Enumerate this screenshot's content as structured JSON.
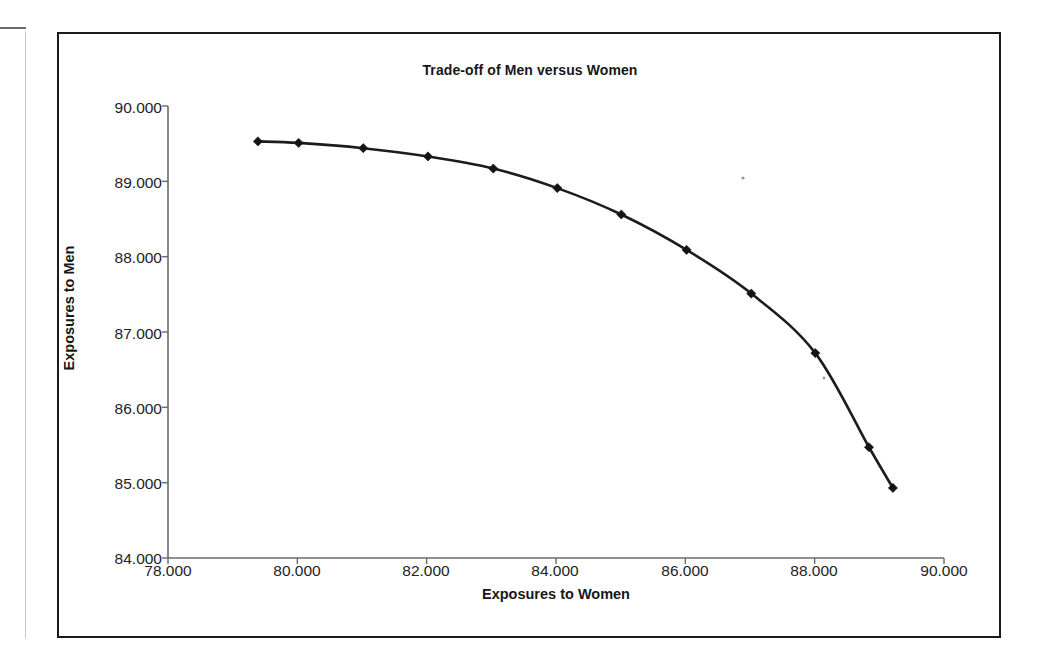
{
  "page": {
    "background_color": "#ffffff",
    "frame_color": "#1a1a1a",
    "axis_color": "#6b6b6b",
    "series_color": "#1c1c1c"
  },
  "chart_data": {
    "type": "line",
    "title": "Trade-off of Men versus Women",
    "xlabel": "Exposures to Women",
    "ylabel": "Exposures to Men",
    "xlim": [
      78.0,
      90.0
    ],
    "ylim": [
      84.0,
      90.0
    ],
    "xticks": [
      78.0,
      80.0,
      82.0,
      84.0,
      86.0,
      88.0,
      90.0
    ],
    "yticks": [
      84.0,
      85.0,
      86.0,
      87.0,
      88.0,
      89.0,
      90.0
    ],
    "xtick_labels": [
      "78.000",
      "80.000",
      "82.000",
      "84.000",
      "86.000",
      "88.000",
      "90.000"
    ],
    "ytick_labels": [
      "84.000",
      "85.000",
      "86.000",
      "87.000",
      "88.000",
      "89.000",
      "90.000"
    ],
    "grid": false,
    "legend": false,
    "marker": "diamond",
    "series": [
      {
        "name": "Trade-off curve",
        "x": [
          79.39,
          80.02,
          81.02,
          82.02,
          83.03,
          84.02,
          85.01,
          86.02,
          87.02,
          88.01,
          88.84,
          89.21
        ],
        "y": [
          89.53,
          89.51,
          89.44,
          89.33,
          89.17,
          88.91,
          88.56,
          88.09,
          87.51,
          86.72,
          85.47,
          84.93
        ]
      }
    ]
  },
  "icons": {
    "page_edge": "page-edge-mark",
    "fold_line": "page-fold-line"
  }
}
